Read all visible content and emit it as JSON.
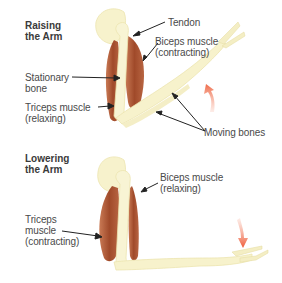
{
  "panels": [
    {
      "id": "raising",
      "heading": "Raising\nthe Arm",
      "labels": {
        "tendon": "Tendon",
        "biceps": "Biceps muscle\n(contracting)",
        "stationary_bone": "Stationary\nbone",
        "triceps": "Triceps muscle\n(relaxing)",
        "moving_bones": "Moving bones"
      },
      "motion_arrow": "up"
    },
    {
      "id": "lowering",
      "heading": "Lowering\nthe Arm",
      "labels": {
        "biceps": "Biceps muscle\n(relaxing)",
        "triceps": "Triceps\nmuscle\n(contracting)"
      },
      "motion_arrow": "down"
    }
  ],
  "colors": {
    "bone": "#f7f2cc",
    "bone_shade": "#ece4b0",
    "muscle": "#a8502f",
    "muscle_light": "#c97a55",
    "arrow": "#f0704f",
    "leader": "#222222",
    "text": "#4a4a4a"
  }
}
